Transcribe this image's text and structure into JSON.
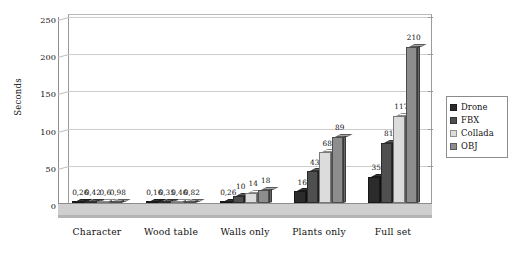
{
  "chart_data": {
    "type": "bar",
    "title": "",
    "subtitle": "",
    "xlabel": "",
    "ylabel": "Seconds",
    "ylim": [
      0,
      250
    ],
    "yticks": [
      0,
      50,
      100,
      150,
      200,
      250
    ],
    "ytick_labels": [
      "0",
      "50",
      "100",
      "150",
      "200",
      "250"
    ],
    "grid": true,
    "grid_axis": "y",
    "legend_position": "right",
    "style": "3d-grouped-bars",
    "decimal_separator": "comma",
    "categories": [
      "Character",
      "Wood table",
      "Walls only",
      "Plants only",
      "Full set"
    ],
    "series": [
      {
        "name": "Drone",
        "color": "#2b2b2b",
        "values": [
          0.26,
          0.16,
          0.26,
          16,
          35
        ],
        "labels": [
          "0,26",
          "0,16",
          "0,26",
          "16",
          "35"
        ]
      },
      {
        "name": "FBX",
        "color": "#4f4f4f",
        "values": [
          0.42,
          0.35,
          10,
          43,
          81
        ],
        "labels": [
          "0,42",
          "0,35",
          "10",
          "43",
          "81"
        ]
      },
      {
        "name": "Collada",
        "color": "#dcdcdc",
        "values": [
          0.6,
          0.46,
          14,
          68,
          117
        ],
        "labels": [
          "0,6",
          "0,46",
          "14",
          "68",
          "117"
        ]
      },
      {
        "name": "OBJ",
        "color": "#8d8d8d",
        "values": [
          0.98,
          0.82,
          18,
          89,
          210
        ],
        "labels": [
          "0,98",
          "0,82",
          "18",
          "89",
          "210"
        ]
      }
    ]
  },
  "legend": {
    "items": [
      {
        "label": "Drone",
        "color": "#2b2b2b"
      },
      {
        "label": "FBX",
        "color": "#4f4f4f"
      },
      {
        "label": "Collada",
        "color": "#dcdcdc"
      },
      {
        "label": "OBJ",
        "color": "#8d8d8d"
      }
    ]
  },
  "colors": {
    "background": "#ffffff",
    "axis": "#8e8e8e",
    "gridline": "#cccccc",
    "floor": "#cfcfcf",
    "text": "#111111"
  }
}
